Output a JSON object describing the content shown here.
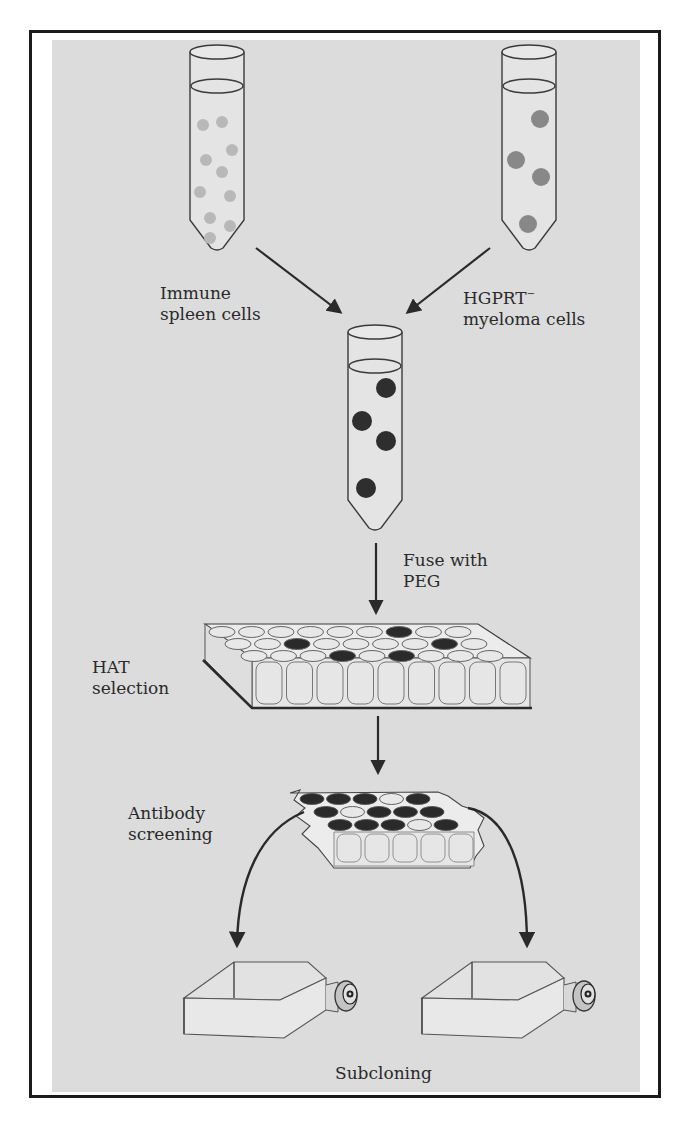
{
  "figure": {
    "colors": {
      "background": "#ffffff",
      "panel": "#dcdcdc",
      "border": "#1a1a1a",
      "line": "#2a2a2a",
      "spleen_cell": "#b8b8b8",
      "myeloma_cell": "#888888",
      "hybrid_cell": "#2e2e2e",
      "well_empty": "#e8e8e8",
      "well_positive": "#2a2a2a"
    }
  },
  "labels": {
    "spleen": {
      "line1": "Immune",
      "line2": "spleen cells"
    },
    "myeloma": {
      "line1": "HGPRT",
      "superscript": "−",
      "line2": "myeloma cells"
    },
    "fuse": {
      "line1": "Fuse with",
      "line2": "PEG"
    },
    "hat": {
      "line1": "HAT",
      "line2": "selection"
    },
    "screening": {
      "line1": "Antibody",
      "line2": "screening"
    },
    "subcloning": {
      "line1": "Subcloning"
    }
  },
  "tubes": [
    {
      "id": "spleen-tube",
      "x": 190,
      "y": 40,
      "cell_color": "spleen_cell",
      "cells": [
        [
          203,
          125
        ],
        [
          222,
          122
        ],
        [
          232,
          150
        ],
        [
          206,
          160
        ],
        [
          222,
          172
        ],
        [
          200,
          192
        ],
        [
          230,
          196
        ],
        [
          210,
          218
        ],
        [
          230,
          226
        ],
        [
          210,
          238
        ]
      ],
      "cell_r": 6
    },
    {
      "id": "myeloma-tube",
      "x": 502,
      "y": 40,
      "cell_color": "myeloma_cell",
      "cells": [
        [
          540,
          119
        ],
        [
          516,
          160
        ],
        [
          541,
          177
        ],
        [
          528,
          224
        ]
      ],
      "cell_r": 9
    },
    {
      "id": "fusion-tube",
      "x": 348,
      "y": 320,
      "cell_color": "hybrid_cell",
      "cells": [
        [
          386,
          388
        ],
        [
          362,
          421
        ],
        [
          386,
          441
        ],
        [
          366,
          488
        ]
      ],
      "cell_r": 10
    }
  ],
  "hat_plate": {
    "rows": 3,
    "cols": 9,
    "positive_wells": [
      [
        0,
        6
      ],
      [
        1,
        2
      ],
      [
        1,
        7
      ],
      [
        2,
        3
      ],
      [
        2,
        5
      ]
    ]
  },
  "screening_plate": {
    "rows": 3,
    "cols": 5,
    "positive_wells": [
      [
        0,
        0
      ],
      [
        0,
        1
      ],
      [
        0,
        2
      ],
      [
        0,
        4
      ],
      [
        1,
        0
      ],
      [
        1,
        2
      ],
      [
        1,
        3
      ],
      [
        1,
        4
      ],
      [
        2,
        0
      ],
      [
        2,
        1
      ],
      [
        2,
        2
      ],
      [
        2,
        4
      ]
    ]
  },
  "flasks": [
    {
      "id": "subclone-flask-left",
      "x": 180
    },
    {
      "id": "subclone-flask-right",
      "x": 418
    }
  ]
}
